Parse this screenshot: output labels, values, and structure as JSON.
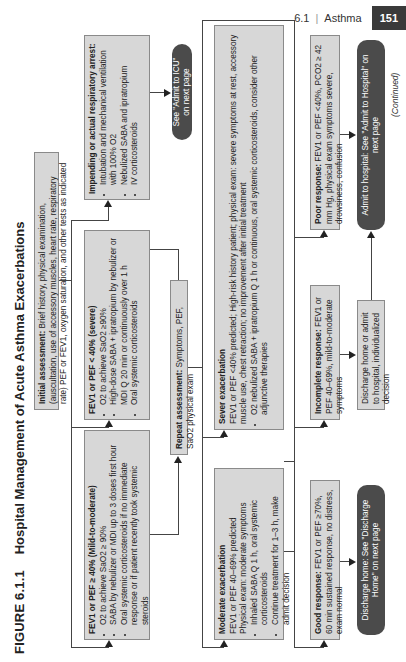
{
  "header": {
    "section": "6.1",
    "separator": "|",
    "chapter": "Asthma",
    "page_number": "151"
  },
  "figure": {
    "label": "FIGURE 6.1.1",
    "title": "Hospital Management of Acute Asthma Exacerbations"
  },
  "nodes": {
    "initial_assessment": {
      "heading": "Initial assessment:",
      "text": "Brief history, physical examination, (auscultation, use of accessory muscles, heart rate, respiratory rate) PEF or FEV1, oxygen saturation, and other tests as indicated"
    },
    "mild_moderate": {
      "heading": "FEV1 or PEF ≥ 40% (Mild-to-moderate)",
      "bullets": [
        "O2 to achieve SaO2 ≥ 90%",
        "SABA by nebulizer or MDI up to 3 doses first hour",
        "Oral systemic corticosteroids if no immediate response or if patient recently took systemic steroids"
      ]
    },
    "severe": {
      "heading": "FEV1 or PEF < 40% (severe)",
      "bullets": [
        "O2 to achieve SaO2 ≥90%",
        "High-dose SABA + ipratropium by nebulizer or MDI Q 20 min or continuously over 1 h",
        "Oral systemic corticosteroids"
      ]
    },
    "impending_arrest": {
      "heading": "Impending or actual respiratory arrest:",
      "bullets": [
        "Intubation and mechanical ventilation with 100% O2",
        "Nebulized SABA and ipratropium",
        "IV corticosteroids"
      ]
    },
    "admit_icu": {
      "text": "See \"Admit to ICU\" on next page"
    },
    "repeat_assessment": {
      "heading": "Repeat assessment:",
      "text": "Symptoms, PEF, SaO2 physical exam"
    },
    "moderate_exacerbation": {
      "heading": "Moderate exacerbation",
      "lines": [
        "FEV1 or PEF 40–69% predicted",
        "Physical exam: moderate symptoms"
      ],
      "bullets": [
        "Inhaled SABA Q 1 h, oral systemic corticosteroids",
        "Continue treatment for 1–3 h, make admit decision"
      ]
    },
    "severe_exacerbation": {
      "heading": "Sever exacerbation",
      "lines": [
        "FEV1 or PEF <40% predicted; High-risk history patient; physical exam: severe symptoms at rest, accessory muscle use, chest retraction; no improvement after initial treatment"
      ],
      "bullets": [
        "O2 nebulized SABA + ipratropium Q 1 h or continuous, oral systemic corticosteroids, consider other adjunctive therapies"
      ]
    },
    "good_response": {
      "heading": "Good response:",
      "text": "FEV1 or PEF ≥70%, 60 min sustained response, no distress, exam normal"
    },
    "discharge_home": {
      "text": "Discharge home: See \"Discharge Home\" on next page"
    },
    "incomplete_response": {
      "heading": "Incomplete response:",
      "text": "FEV1 or PEF 40–69%, mild-to-moderate symptoms"
    },
    "discharge_or_admit": {
      "text": "Discharge home or admit to hospital, individualized decision"
    },
    "poor_response": {
      "heading": "Poor response:",
      "text": "FEV1 or PEF <40%, PCO2 ≥ 42 mm Hg, physical exam symptoms severe, drowsiness, confusion"
    },
    "admit_hospital": {
      "text": "Admit to hospital: See \"Admit to Hospital\" on next page"
    }
  },
  "continued_label": "(Continued)",
  "colors": {
    "box_fill": "#d7d7d7",
    "box_border": "#8a8a8a",
    "pill_fill": "#4b4b4b",
    "page_badge": "#3a3a3a"
  }
}
